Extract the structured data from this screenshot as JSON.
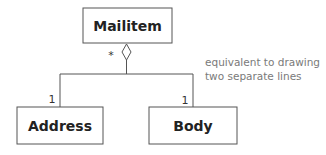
{
  "diagram": {
    "type": "uml-class-aggregation",
    "classes": [
      {
        "id": "mailitem",
        "name": "Mailitem"
      },
      {
        "id": "address",
        "name": "Address"
      },
      {
        "id": "body",
        "name": "Body"
      }
    ],
    "aggregation": {
      "whole": "Mailitem",
      "whole_multiplicity": "*",
      "parts": [
        {
          "name": "Address",
          "multiplicity": "1"
        },
        {
          "name": "Body",
          "multiplicity": "1"
        }
      ]
    },
    "note": {
      "line1": "equivalent to drawing",
      "line2": "two separate lines"
    }
  }
}
